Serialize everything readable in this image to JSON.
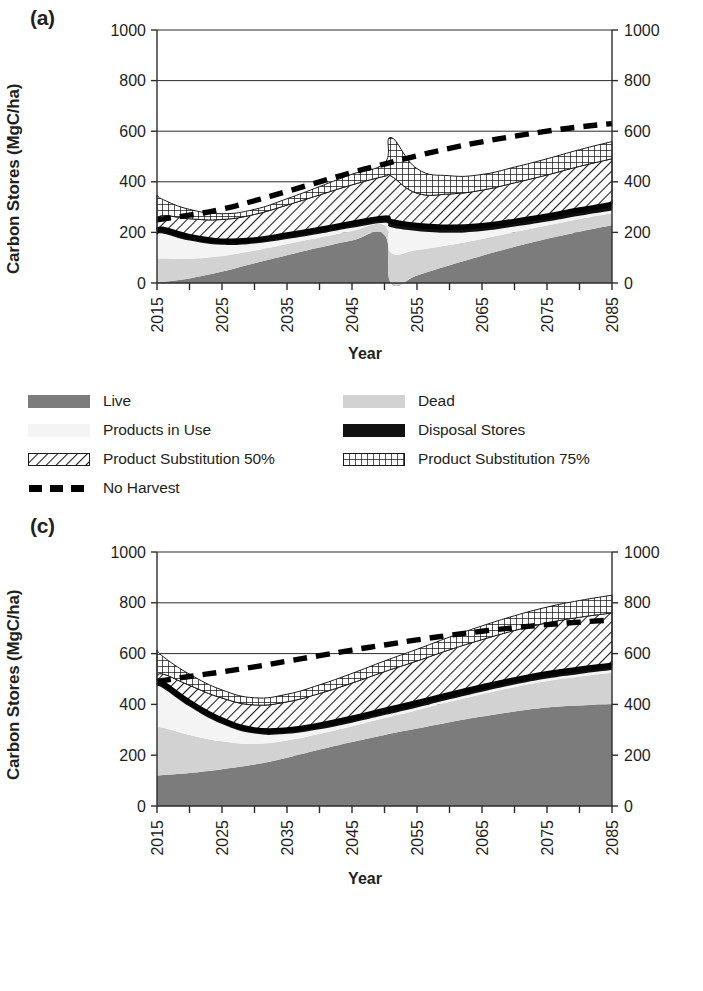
{
  "figure": {
    "panels": [
      {
        "id": "a",
        "label": "(a)",
        "ylabel": "Carbon Stores (MgC/ha)",
        "xlabel": "Year",
        "has_no_harvest_in_legend": true
      },
      {
        "id": "c",
        "label": "(c)",
        "ylabel": "Carbon Stores (MgC/ha)",
        "xlabel": "Year",
        "has_no_harvest_in_legend": false
      }
    ],
    "legend_entries": [
      {
        "key": "live",
        "label": "Live",
        "swatch": "solid-dark-gray",
        "color": "#7c7c7c"
      },
      {
        "key": "dead",
        "label": "Dead",
        "swatch": "solid-light-gray",
        "color": "#d2d2d2"
      },
      {
        "key": "products_in_use",
        "label": "Products in Use",
        "swatch": "solid-near-white",
        "color": "#f4f4f4"
      },
      {
        "key": "disposal_stores",
        "label": "Disposal Stores",
        "swatch": "solid-black",
        "color": "#111111"
      },
      {
        "key": "product_substitution_50",
        "label": "Product Substitution 50%",
        "swatch": "diagonal-hatch",
        "color": "#ffffff"
      },
      {
        "key": "product_substitution_75",
        "label": "Product Substitution 75%",
        "swatch": "cross-hatch",
        "color": "#ffffff"
      },
      {
        "key": "no_harvest",
        "label": "No Harvest",
        "swatch": "dashed-line",
        "color": "#000000"
      }
    ]
  },
  "chart_data": [
    {
      "panel": "a",
      "type": "area",
      "title": "(a)",
      "xlabel": "Year",
      "ylabel": "Carbon Stores (MgC/ha)",
      "ylim": [
        0,
        1000
      ],
      "yticks": [
        0,
        200,
        400,
        600,
        800,
        1000
      ],
      "ytick_labels": [
        "0",
        "200",
        "400",
        "600",
        "800",
        "1000"
      ],
      "xlim": [
        2015,
        2085
      ],
      "xticks": [
        2015,
        2020,
        2025,
        2030,
        2035,
        2040,
        2045,
        2050,
        2055,
        2060,
        2065,
        2070,
        2075,
        2080,
        2085
      ],
      "xtick_labels": [
        "2015",
        "",
        "2025",
        "",
        "2035",
        "",
        "2045",
        "",
        "2055",
        "",
        "2065",
        "",
        "2075",
        "",
        "2085"
      ],
      "grid": "horizontal",
      "legend_position": "below",
      "stacked": true,
      "x": [
        2015,
        2016,
        2020,
        2025,
        2030,
        2035,
        2040,
        2045,
        2050,
        2051,
        2055,
        2060,
        2065,
        2070,
        2075,
        2080,
        2085
      ],
      "series": [
        {
          "name": "Live",
          "values": [
            0,
            5,
            18,
            45,
            78,
            110,
            140,
            168,
            190,
            0,
            30,
            70,
            108,
            143,
            175,
            203,
            228
          ]
        },
        {
          "name": "Dead",
          "values": [
            95,
            92,
            78,
            62,
            50,
            44,
            40,
            38,
            38,
            120,
            100,
            80,
            66,
            58,
            52,
            50,
            48
          ]
        },
        {
          "name": "Products in Use",
          "values": [
            95,
            98,
            72,
            44,
            28,
            20,
            15,
            12,
            10,
            100,
            76,
            50,
            32,
            22,
            16,
            13,
            11
          ]
        },
        {
          "name": "Disposal Stores",
          "values": [
            16,
            17,
            16,
            15,
            15,
            16,
            17,
            18,
            19,
            23,
            22,
            21,
            21,
            21,
            22,
            23,
            24
          ]
        },
        {
          "name": "Product Substitution 50%",
          "values": [
            42,
            55,
            70,
            85,
            100,
            118,
            136,
            152,
            165,
            180,
            127,
            131,
            140,
            152,
            162,
            172,
            180
          ]
        },
        {
          "name": "Product Substitution 75%",
          "values": [
            100,
            62,
            37,
            23,
            20,
            25,
            33,
            42,
            52,
            152,
            97,
            72,
            62,
            62,
            64,
            66,
            68
          ]
        }
      ],
      "overlay_lines": [
        {
          "name": "No Harvest",
          "style": "dashed",
          "x": [
            2015,
            2020,
            2025,
            2030,
            2035,
            2040,
            2045,
            2050,
            2055,
            2060,
            2065,
            2070,
            2075,
            2080,
            2085
          ],
          "values": [
            250,
            268,
            292,
            325,
            362,
            400,
            437,
            470,
            503,
            532,
            558,
            580,
            600,
            617,
            630
          ]
        }
      ]
    },
    {
      "panel": "c",
      "type": "area",
      "title": "(c)",
      "xlabel": "Year",
      "ylabel": "Carbon Stores (MgC/ha)",
      "ylim": [
        0,
        1000
      ],
      "yticks": [
        0,
        200,
        400,
        600,
        800,
        1000
      ],
      "ytick_labels": [
        "0",
        "200",
        "400",
        "600",
        "800",
        "1000"
      ],
      "xlim": [
        2015,
        2085
      ],
      "xticks": [
        2015,
        2020,
        2025,
        2030,
        2035,
        2040,
        2045,
        2050,
        2055,
        2060,
        2065,
        2070,
        2075,
        2080,
        2085
      ],
      "xtick_labels": [
        "2015",
        "",
        "2025",
        "",
        "2035",
        "",
        "2045",
        "",
        "2055",
        "",
        "2065",
        "",
        "2075",
        "",
        "2085"
      ],
      "grid": "horizontal",
      "legend_position": "below",
      "stacked": true,
      "x": [
        2015,
        2016,
        2020,
        2025,
        2030,
        2035,
        2040,
        2045,
        2050,
        2055,
        2060,
        2065,
        2070,
        2075,
        2080,
        2085
      ],
      "series": [
        {
          "name": "Live",
          "values": [
            120,
            122,
            130,
            145,
            163,
            190,
            222,
            252,
            280,
            305,
            330,
            352,
            372,
            388,
            396,
            400
          ]
        },
        {
          "name": "Dead",
          "values": [
            190,
            186,
            150,
            110,
            82,
            68,
            62,
            62,
            66,
            72,
            80,
            88,
            96,
            104,
            114,
            125
          ]
        },
        {
          "name": "Products in Use",
          "values": [
            160,
            155,
            112,
            68,
            40,
            26,
            18,
            14,
            12,
            11,
            10,
            10,
            10,
            10,
            10,
            10
          ]
        },
        {
          "name": "Disposal Stores",
          "values": [
            18,
            18,
            17,
            16,
            15,
            16,
            17,
            18,
            19,
            19,
            19,
            19,
            19,
            19,
            19,
            19
          ]
        },
        {
          "name": "Product Substitution 50%",
          "values": [
            22,
            38,
            66,
            86,
            98,
            110,
            124,
            138,
            152,
            164,
            176,
            186,
            194,
            200,
            204,
            206
          ]
        },
        {
          "name": "Product Substitution 75%",
          "values": [
            105,
            68,
            44,
            32,
            28,
            30,
            34,
            38,
            42,
            46,
            50,
            54,
            58,
            62,
            66,
            70
          ]
        }
      ],
      "overlay_lines": [
        {
          "name": "No Harvest",
          "style": "dashed",
          "x": [
            2015,
            2020,
            2025,
            2030,
            2035,
            2040,
            2045,
            2050,
            2055,
            2060,
            2065,
            2070,
            2075,
            2080,
            2085
          ],
          "values": [
            490,
            510,
            528,
            548,
            570,
            592,
            614,
            634,
            654,
            672,
            688,
            702,
            714,
            724,
            732
          ]
        }
      ]
    }
  ]
}
